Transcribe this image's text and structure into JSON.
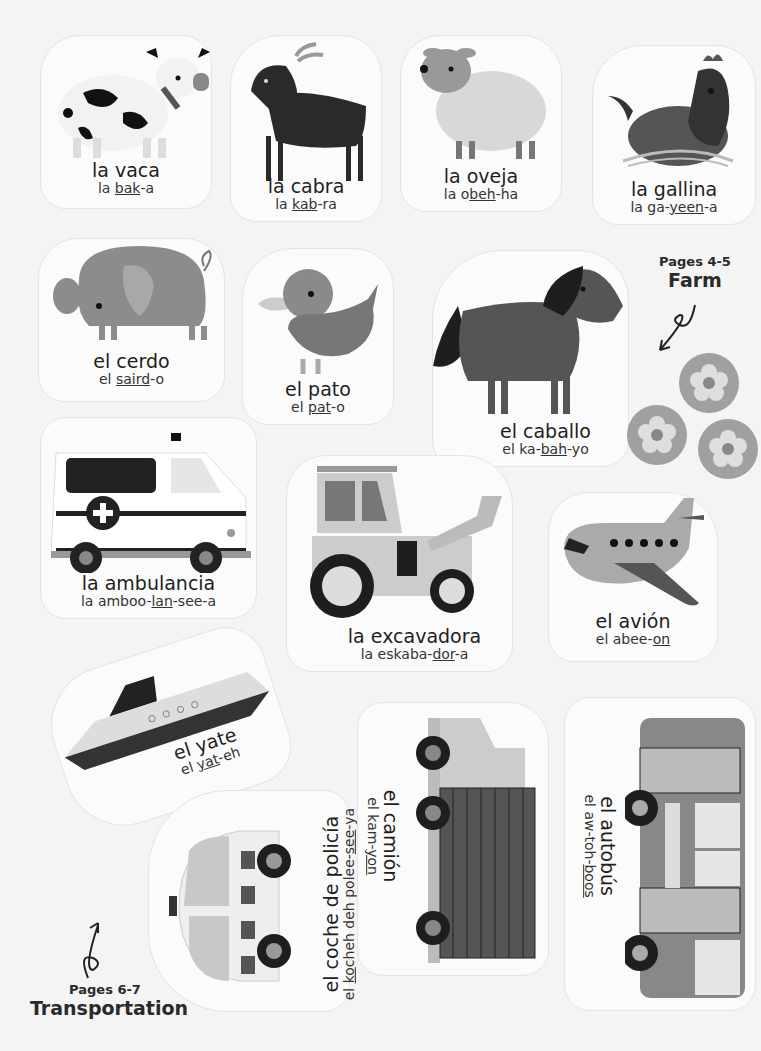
{
  "sections": {
    "farm": {
      "pages": "Pages 4-5",
      "title": "Farm"
    },
    "transportation": {
      "pages": "Pages 6-7",
      "title": "Transportation"
    }
  },
  "stickers": [
    {
      "id": "vaca",
      "word": "la vaca",
      "pron_pre": "la ",
      "pron_stress": "bak",
      "pron_post": "-a"
    },
    {
      "id": "cabra",
      "word": "la cabra",
      "pron_pre": "la ",
      "pron_stress": "kab",
      "pron_post": "-ra"
    },
    {
      "id": "oveja",
      "word": "la oveja",
      "pron_pre": "la o",
      "pron_stress": "beh",
      "pron_post": "-ha"
    },
    {
      "id": "gallina",
      "word": "la gallina",
      "pron_pre": "la ga-",
      "pron_stress": "yeen",
      "pron_post": "-a"
    },
    {
      "id": "cerdo",
      "word": "el cerdo",
      "pron_pre": "el ",
      "pron_stress": "saird",
      "pron_post": "-o"
    },
    {
      "id": "pato",
      "word": "el pato",
      "pron_pre": "el ",
      "pron_stress": "pat",
      "pron_post": "-o"
    },
    {
      "id": "caballo",
      "word": "el caballo",
      "pron_pre": "el ka-",
      "pron_stress": "bah",
      "pron_post": "-yo"
    },
    {
      "id": "ambulancia",
      "word": "la ambulancia",
      "pron_pre": "la amboo-",
      "pron_stress": "lan",
      "pron_post": "-see-a"
    },
    {
      "id": "excavadora",
      "word": "la excavadora",
      "pron_pre": "la eskaba-",
      "pron_stress": "dor",
      "pron_post": "-a"
    },
    {
      "id": "avion",
      "word": "el avión",
      "pron_pre": "el abee-",
      "pron_stress": "on",
      "pron_post": ""
    },
    {
      "id": "yate",
      "word": "el yate",
      "pron_pre": "el ",
      "pron_stress": "yat",
      "pron_post": "-eh"
    },
    {
      "id": "coche",
      "word": "el coche de policía",
      "pron_pre": "el ",
      "pron_stress": "ko",
      "pron_post": "cheh deh polee-",
      "pron_stress2": "see",
      "pron_post2": "-ya"
    },
    {
      "id": "camion",
      "word": "el camión",
      "pron_pre": "el kam-",
      "pron_stress": "yon",
      "pron_post": ""
    },
    {
      "id": "autobus",
      "word": "el autobús",
      "pron_pre": "el aw-toh-",
      "pron_stress": "boos",
      "pron_post": ""
    }
  ],
  "colors": {
    "background": "#f4f4f4",
    "sticker": "#fbfbfb",
    "dark": "#1e1e1e",
    "mid_gray": "#8a8a8a",
    "light_gray": "#c8c8c8"
  }
}
